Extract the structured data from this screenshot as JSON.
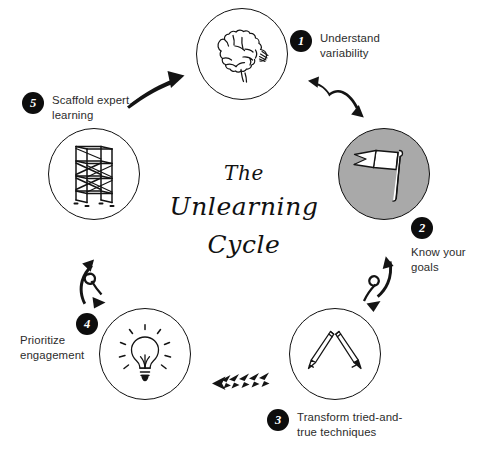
{
  "diagram": {
    "title_lines": [
      "The",
      "Unlearning",
      "Cycle"
    ],
    "title_full": "The Unlearning Cycle",
    "background_color": "#ffffff",
    "accent_fill_color": "#a9a9a9",
    "badge_color": "#0d0d0d",
    "text_color": "#2c2c2c"
  },
  "steps": [
    {
      "number": "1",
      "label": "Understand\nvariability",
      "icon": "brain-icon",
      "highlighted": false
    },
    {
      "number": "2",
      "label": "Know your\ngoals",
      "icon": "flag-icon",
      "highlighted": true
    },
    {
      "number": "3",
      "label": "Transform tried-and-\ntrue techniques",
      "icon": "pencils-icon",
      "highlighted": false
    },
    {
      "number": "4",
      "label": "Prioritize\nengagement",
      "icon": "lightbulb-icon",
      "highlighted": false
    },
    {
      "number": "5",
      "label": "Scaffold expert\nlearning",
      "icon": "scaffolding-icon",
      "highlighted": false
    }
  ],
  "connectors": [
    {
      "name": "arrow-1-to-2",
      "style": "double-bend-arrow"
    },
    {
      "name": "arrow-2-to-3",
      "style": "loop-curl-arrow"
    },
    {
      "name": "arrow-3-to-4",
      "style": "zigzag-arrow"
    },
    {
      "name": "arrow-4-to-5",
      "style": "loop-curl-arrow"
    },
    {
      "name": "arrow-5-to-1",
      "style": "curved-arrow"
    }
  ]
}
